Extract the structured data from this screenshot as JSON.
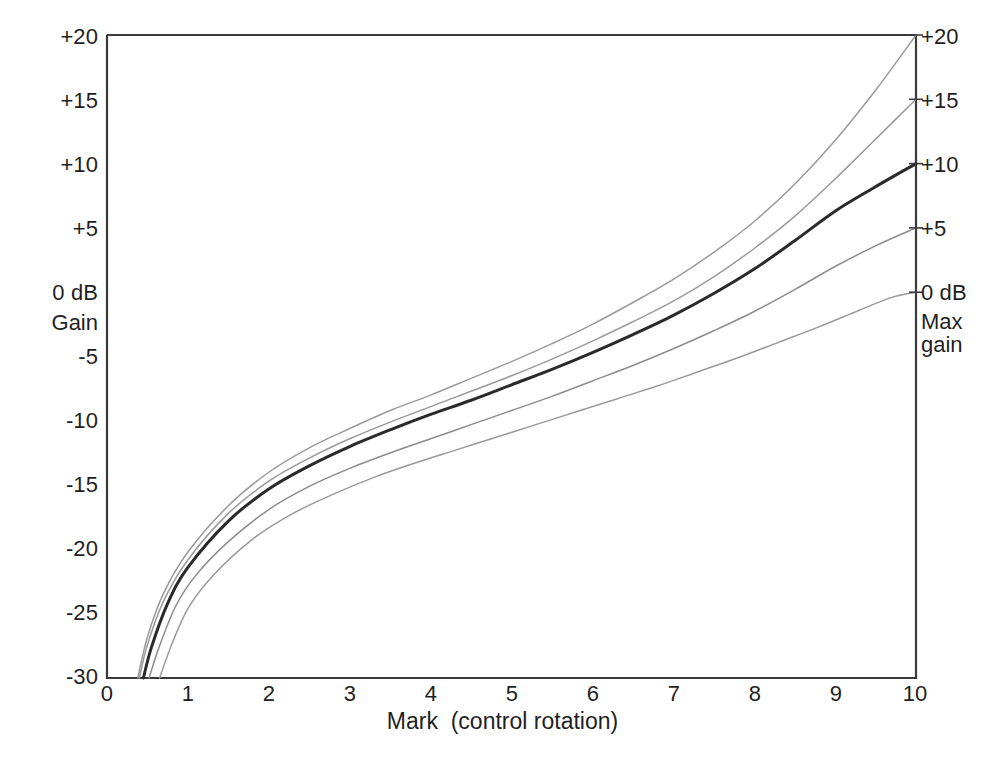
{
  "figure": {
    "kind": "line-chart",
    "background": "#ffffff",
    "frame_color": "#3a3a3a"
  },
  "axis_titles": {
    "x": "Mark  (control rotation)",
    "y_left_unit": "0 dB",
    "y_left_name": "Gain",
    "y_right_unit": "0 dB",
    "y_right_name": "Max\ngain"
  },
  "y_ticks_left": [
    "+20",
    "+15",
    "+10",
    "+5",
    "0 dB",
    "-5",
    "-10",
    "-15",
    "-20",
    "-25",
    "-30"
  ],
  "y_ticks_right": [
    "+20",
    "+15",
    "+10",
    "+5",
    "0 dB"
  ],
  "x_ticks": [
    "0",
    "1",
    "2",
    "3",
    "4",
    "5",
    "6",
    "7",
    "8",
    "9",
    "10"
  ],
  "curve_colors": {
    "light": "#9a9a9a",
    "mid": "#8c8c8c",
    "dark": "#2a2a2a"
  },
  "chart_data": {
    "type": "line",
    "title": "",
    "xlabel": "Mark  (control rotation)",
    "ylabel": "Gain",
    "xlim": [
      0,
      10
    ],
    "ylim": [
      -30,
      20
    ],
    "grid": false,
    "legend": "none",
    "y_unit": "dB",
    "y_tick_values": [
      -30,
      -25,
      -20,
      -15,
      -10,
      -5,
      0,
      5,
      10,
      15,
      20
    ],
    "x_tick_values": [
      0,
      1,
      2,
      3,
      4,
      5,
      6,
      7,
      8,
      9,
      10
    ],
    "annotations": [
      {
        "text": "0 dB",
        "position": "left-axis",
        "value": 0
      },
      {
        "text": "Gain",
        "position": "left-axis-below",
        "value": -2
      },
      {
        "text": "0 dB",
        "position": "right-axis",
        "value": 0
      },
      {
        "text": "Max gain",
        "position": "right-axis-below",
        "value": -2
      }
    ],
    "series": [
      {
        "name": "+20 dB max gain",
        "end_label": "+20",
        "emphasis": "normal",
        "color": "#9a9a9a",
        "x": [
          0.38,
          0.5,
          0.7,
          1.0,
          1.5,
          2.0,
          2.5,
          3.0,
          3.5,
          4.0,
          4.5,
          5.0,
          5.5,
          6.0,
          6.5,
          7.0,
          7.5,
          8.0,
          8.5,
          9.0,
          9.5,
          10.0
        ],
        "y": [
          -30.0,
          -26.8,
          -23.4,
          -20.2,
          -16.6,
          -14.0,
          -12.1,
          -10.6,
          -9.2,
          -8.0,
          -6.7,
          -5.4,
          -4.0,
          -2.5,
          -0.8,
          1.0,
          3.1,
          5.5,
          8.4,
          11.8,
          15.7,
          20.0
        ]
      },
      {
        "name": "+15 dB max gain",
        "end_label": "+15",
        "emphasis": "normal",
        "color": "#9a9a9a",
        "x": [
          0.4,
          0.5,
          0.7,
          1.0,
          1.5,
          2.0,
          2.5,
          3.0,
          3.5,
          4.0,
          4.5,
          5.0,
          5.5,
          6.0,
          6.5,
          7.0,
          7.5,
          8.0,
          8.5,
          9.0,
          9.5,
          10.0
        ],
        "y": [
          -30.0,
          -27.4,
          -24.0,
          -20.8,
          -17.2,
          -14.7,
          -12.9,
          -11.4,
          -10.1,
          -8.9,
          -7.7,
          -6.5,
          -5.2,
          -3.8,
          -2.3,
          -0.7,
          1.2,
          3.4,
          5.9,
          8.8,
          11.9,
          15.0
        ]
      },
      {
        "name": "+10 dB max gain (nominal law)",
        "end_label": "+10",
        "emphasis": "bold",
        "color": "#2a2a2a",
        "x": [
          0.45,
          0.55,
          0.75,
          1.0,
          1.5,
          2.0,
          2.5,
          3.0,
          3.5,
          4.0,
          4.5,
          5.0,
          5.5,
          6.0,
          6.5,
          7.0,
          7.5,
          8.0,
          8.5,
          9.0,
          9.5,
          10.0
        ],
        "y": [
          -30.0,
          -27.6,
          -24.2,
          -21.4,
          -17.8,
          -15.3,
          -13.5,
          -12.0,
          -10.7,
          -9.5,
          -8.4,
          -7.2,
          -6.0,
          -4.7,
          -3.3,
          -1.8,
          -0.1,
          1.8,
          4.0,
          6.3,
          8.2,
          10.0
        ]
      },
      {
        "name": "+5 dB max gain",
        "end_label": "+5",
        "emphasis": "normal",
        "color": "#8c8c8c",
        "x": [
          0.52,
          0.65,
          0.85,
          1.1,
          1.5,
          2.0,
          2.5,
          3.0,
          3.5,
          4.0,
          4.5,
          5.0,
          5.5,
          6.0,
          6.5,
          7.0,
          7.5,
          8.0,
          8.5,
          9.0,
          9.5,
          10.0
        ],
        "y": [
          -30.0,
          -27.5,
          -24.4,
          -22.0,
          -19.4,
          -16.9,
          -15.1,
          -13.7,
          -12.5,
          -11.4,
          -10.3,
          -9.2,
          -8.1,
          -6.9,
          -5.7,
          -4.4,
          -3.0,
          -1.5,
          0.2,
          2.0,
          3.6,
          5.0
        ]
      },
      {
        "name": "0 dB max gain",
        "end_label": "0 dB",
        "emphasis": "normal",
        "color": "#9a9a9a",
        "x": [
          0.65,
          0.8,
          1.0,
          1.3,
          1.8,
          2.3,
          2.8,
          3.3,
          3.8,
          4.3,
          4.8,
          5.3,
          5.8,
          6.3,
          6.8,
          7.3,
          7.8,
          8.3,
          8.8,
          9.3,
          9.7,
          10.0
        ],
        "y": [
          -30.0,
          -27.4,
          -24.6,
          -22.1,
          -19.2,
          -17.2,
          -15.7,
          -14.4,
          -13.3,
          -12.3,
          -11.3,
          -10.3,
          -9.3,
          -8.3,
          -7.3,
          -6.2,
          -5.1,
          -3.9,
          -2.7,
          -1.4,
          -0.4,
          0.0
        ]
      }
    ]
  },
  "caption": ""
}
